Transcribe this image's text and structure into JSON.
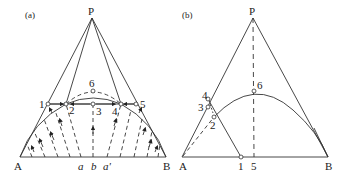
{
  "figure": {
    "panels": [
      {
        "id": "a",
        "panel_label": "(a)",
        "vertices": {
          "top": "P",
          "left": "A",
          "right": "B"
        },
        "points": [
          "1",
          "2",
          "3",
          "4",
          "5",
          "6"
        ],
        "base_labels": [
          "a",
          "b",
          "a'"
        ]
      },
      {
        "id": "b",
        "panel_label": "(b)",
        "vertices": {
          "top": "P",
          "left": "A",
          "right": "B"
        },
        "points": [
          "1",
          "2",
          "3",
          "4",
          "5",
          "6"
        ]
      }
    ],
    "colors": {
      "line": "#333333",
      "background": "#ffffff"
    }
  }
}
